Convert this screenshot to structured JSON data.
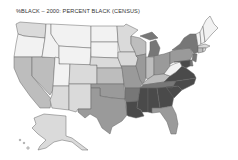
{
  "title": "%BLACK – 2000: PERCENT BLACK (CENSUS)",
  "map": {
    "type": "choropleth",
    "region": "United States",
    "variable": "Percent Black population, 2000 Census",
    "shade_scale": [
      "#f2f2f2",
      "#dadada",
      "#bdbdbd",
      "#9a9a9a",
      "#777777",
      "#4a4a4a"
    ],
    "states": {
      "WA": 1,
      "OR": 0,
      "ID": 0,
      "MT": 0,
      "WY": 0,
      "NV": 2,
      "CA": 2,
      "UT": 0,
      "CO": 1,
      "AZ": 1,
      "NM": 1,
      "ND": 0,
      "SD": 0,
      "NE": 1,
      "KS": 2,
      "OK": 3,
      "TX": 3,
      "MN": 1,
      "IA": 1,
      "MO": 3,
      "AR": 4,
      "LA": 5,
      "WI": 2,
      "IL": 3,
      "MI": 4,
      "IN": 2,
      "OH": 3,
      "KY": 2,
      "TN": 4,
      "MS": 5,
      "AL": 5,
      "GA": 5,
      "FL": 3,
      "SC": 5,
      "NC": 5,
      "VA": 5,
      "WV": 0,
      "PA": 3,
      "NY": 4,
      "VT": 0,
      "NH": 0,
      "ME": 0,
      "MA": 1,
      "CT": 2,
      "RI": 1,
      "NJ": 4,
      "DE": 4,
      "MD": 5,
      "AK": 1,
      "HI": 0
    }
  }
}
